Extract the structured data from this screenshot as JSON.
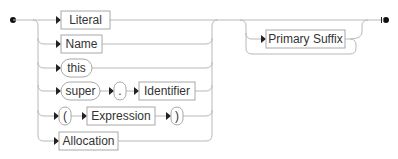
{
  "diagram": {
    "type": "railroad-syntax-diagram",
    "alternatives": [
      {
        "kind": "nonterminal",
        "label": "Literal"
      },
      {
        "kind": "nonterminal",
        "label": "Name"
      },
      {
        "kind": "terminal",
        "label": "this"
      },
      {
        "sequence": [
          {
            "kind": "terminal",
            "label": "super"
          },
          {
            "kind": "terminal",
            "label": "."
          },
          {
            "kind": "nonterminal",
            "label": "Identifier"
          }
        ]
      },
      {
        "sequence": [
          {
            "kind": "terminal",
            "label": "("
          },
          {
            "kind": "nonterminal",
            "label": "Expression"
          },
          {
            "kind": "terminal",
            "label": ")"
          }
        ]
      },
      {
        "kind": "nonterminal",
        "label": "Allocation"
      }
    ],
    "loop": {
      "kind": "nonterminal",
      "label": "Primary Suffix",
      "repeat": "zero-or-more"
    }
  },
  "labels": {
    "literal": "Literal",
    "name": "Name",
    "this": "this",
    "super": "super",
    "dot": ".",
    "identifier": "Identifier",
    "lparen": "(",
    "expression": "Expression",
    "rparen": ")",
    "allocation": "Allocation",
    "primary_suffix": "Primary Suffix"
  }
}
